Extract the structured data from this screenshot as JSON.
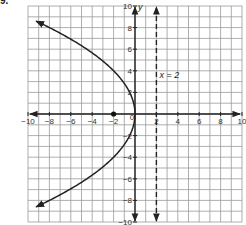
{
  "problem_number": "9.",
  "chart_data": {
    "type": "line",
    "title": "",
    "xlabel": "",
    "ylabel": "y",
    "xlim": [
      -10,
      10
    ],
    "ylim": [
      -10,
      10
    ],
    "grid": true,
    "x_ticks": [
      -10,
      -8,
      -6,
      -4,
      -2,
      0,
      2,
      4,
      6,
      8,
      10
    ],
    "y_ticks": [
      -10,
      -8,
      -6,
      -4,
      -2,
      2,
      4,
      6,
      8,
      10
    ],
    "series": [
      {
        "name": "parabola",
        "equation": "x = -y^2/8",
        "style": "solid",
        "arrows": "both ends",
        "points": [
          [
            -9,
            8.5
          ],
          [
            -8,
            8
          ],
          [
            -4.5,
            6
          ],
          [
            -2,
            4
          ],
          [
            -0.5,
            2
          ],
          [
            0,
            0
          ],
          [
            -0.5,
            -2
          ],
          [
            -2,
            -4
          ],
          [
            -4.5,
            -6
          ],
          [
            -8,
            -8
          ],
          [
            -9,
            -8.5
          ]
        ]
      },
      {
        "name": "directrix",
        "equation": "x = 2",
        "style": "dashed",
        "arrows": "both ends",
        "points": [
          [
            2,
            -10
          ],
          [
            2,
            10
          ]
        ]
      }
    ],
    "points": [
      {
        "name": "focus",
        "x": -2,
        "y": 0
      }
    ],
    "annotations": [
      {
        "text": "x = 2",
        "x": 2.3,
        "y": 3.3
      },
      {
        "text": "0",
        "x": -0.5,
        "y": -0.6
      }
    ]
  }
}
